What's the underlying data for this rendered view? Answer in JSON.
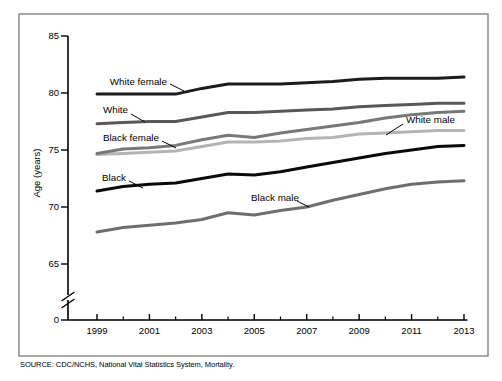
{
  "figure": {
    "source_note": "SOURCE: CDC/NCHS, National Vital Statistics System, Mortality."
  },
  "chart_data": {
    "type": "line",
    "title": "",
    "xlabel": "",
    "ylabel": "Age (years)",
    "x": [
      1999,
      2000,
      2001,
      2002,
      2003,
      2004,
      2005,
      2006,
      2007,
      2008,
      2009,
      2010,
      2011,
      2012,
      2013
    ],
    "x_tick_labels": [
      "1999",
      "2001",
      "2003",
      "2005",
      "2007",
      "2009",
      "2011",
      "2013"
    ],
    "x_minor_tick_years": [
      2000,
      2002,
      2004,
      2006,
      2008,
      2010,
      2012
    ],
    "y_ticks": [
      0,
      65,
      70,
      75,
      80,
      85
    ],
    "y_break_between": [
      0,
      65
    ],
    "ylim": [
      65,
      85
    ],
    "grid": false,
    "legend_position": "inline-labels",
    "series": [
      {
        "name": "White female",
        "color": "#1c1c1c",
        "values": [
          79.9,
          79.9,
          79.9,
          79.9,
          80.4,
          80.8,
          80.8,
          80.8,
          80.9,
          81.0,
          81.2,
          81.3,
          81.3,
          81.3,
          81.4
        ]
      },
      {
        "name": "White",
        "color": "#585858",
        "values": [
          77.3,
          77.4,
          77.5,
          77.5,
          77.9,
          78.3,
          78.3,
          78.4,
          78.5,
          78.6,
          78.8,
          78.9,
          79.0,
          79.1,
          79.1
        ]
      },
      {
        "name": "White male",
        "color": "#b4b4b4",
        "values": [
          74.6,
          74.7,
          74.8,
          74.9,
          75.3,
          75.7,
          75.7,
          75.8,
          76.0,
          76.1,
          76.4,
          76.5,
          76.6,
          76.7,
          76.7
        ]
      },
      {
        "name": "Black female",
        "color": "#787878",
        "values": [
          74.7,
          75.1,
          75.2,
          75.4,
          75.9,
          76.3,
          76.1,
          76.5,
          76.8,
          77.1,
          77.4,
          77.8,
          78.1,
          78.3,
          78.4
        ]
      },
      {
        "name": "Black",
        "color": "#0a0a0a",
        "values": [
          71.4,
          71.8,
          72.0,
          72.1,
          72.5,
          72.9,
          72.8,
          73.1,
          73.5,
          73.9,
          74.3,
          74.7,
          75.0,
          75.3,
          75.4
        ]
      },
      {
        "name": "Black male",
        "color": "#6e6e6e",
        "values": [
          67.8,
          68.2,
          68.4,
          68.6,
          68.9,
          69.5,
          69.3,
          69.7,
          70.0,
          70.6,
          71.1,
          71.6,
          72.0,
          72.2,
          72.3
        ]
      }
    ]
  }
}
